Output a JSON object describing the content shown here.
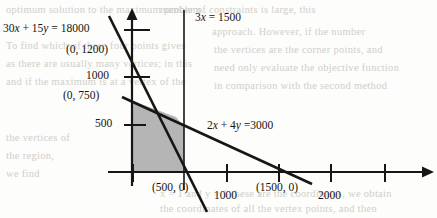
{
  "figure": {
    "type": "line-graph"
  },
  "background_text": {
    "lines": [
      "optimum solution to the maximum problem",
      "To find which of these four points gives",
      "as there are usually many vertices; in this",
      "and if the maximum is at a vertex of the",
      "need only evaluate the objective function",
      "in comparison with the second method"
    ],
    "right_lines": [
      "number of constraints is large, this",
      "approach. However, if the number",
      "the vertices are the corner points, and"
    ],
    "bottom_lines": [
      "x = 1 and y = 1 these are the coordinates, we obtain",
      "the coordinates of all the vertex points, and then"
    ],
    "left_lines": [
      "the vertices of",
      "the region,",
      "we find"
    ]
  },
  "labels": {
    "line1_equation": "30x + 15y = 18000",
    "line1_intercept": "(0, 1200)",
    "line2_equation": "2x + 4y =3000",
    "line2_intercept": "(0, 750)",
    "vertical_line_equation": "3x = 1500",
    "x_intercept_500": "(500, 0)",
    "x_intercept_1500": "(1500, 0)"
  },
  "axes": {
    "y_ticks": [
      "1000",
      "500"
    ],
    "x_ticks": [
      "1000",
      "2000"
    ]
  },
  "colors": {
    "line": "#161616",
    "shading": "#b5b5b5",
    "axis": "#161616",
    "background": "#fdfdfb",
    "ghost_text": "#c9c7c2"
  },
  "chart_data": {
    "type": "line",
    "title": "",
    "xlabel": "",
    "ylabel": "",
    "xlim": [
      0,
      2400
    ],
    "ylim": [
      0,
      1450
    ],
    "grid": false,
    "legend": "none",
    "series": [
      {
        "name": "30x + 15y = 18000",
        "points": [
          [
            0,
            1200
          ],
          [
            600,
            0
          ]
        ],
        "x_intercept": 600,
        "y_intercept": 1200
      },
      {
        "name": "2x + 4y = 3000",
        "points": [
          [
            0,
            750
          ],
          [
            1500,
            0
          ]
        ],
        "x_intercept": 1500,
        "y_intercept": 750
      },
      {
        "name": "3x = 1500",
        "points": [
          [
            500,
            1450
          ],
          [
            500,
            0
          ]
        ],
        "x_intercept": 500,
        "y_intercept": null
      }
    ],
    "shaded_region": {
      "label": "feasible region",
      "vertices": [
        [
          0,
          0
        ],
        [
          0,
          750
        ],
        [
          400,
          550
        ],
        [
          500,
          420
        ],
        [
          500,
          0
        ]
      ],
      "fill": "#b5b5b5"
    },
    "annotations": [
      {
        "text": "(0, 1200)",
        "x": 0,
        "y": 1200
      },
      {
        "text": "(0, 750)",
        "x": 0,
        "y": 750
      },
      {
        "text": "(500, 0)",
        "x": 500,
        "y": 0
      },
      {
        "text": "(1500, 0)",
        "x": 1500,
        "y": 0
      },
      {
        "text": "30x + 15y = 18000",
        "x": 0,
        "y": 1330
      },
      {
        "text": "2x + 4y =3000",
        "x": 800,
        "y": 560
      },
      {
        "text": "3x = 1500",
        "x": 560,
        "y": 1390
      }
    ],
    "x_tick_values": [
      1000,
      2000
    ],
    "y_tick_values": [
      500,
      1000
    ]
  }
}
